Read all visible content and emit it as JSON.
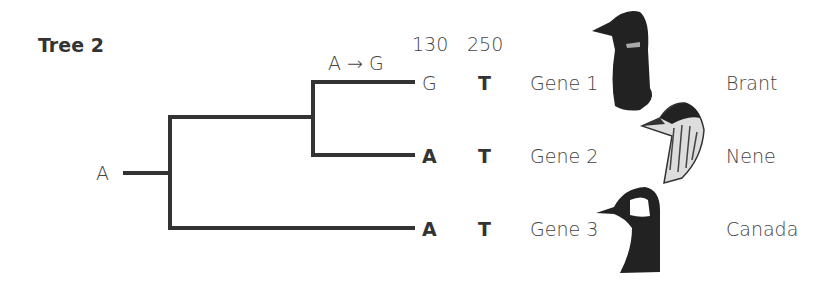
{
  "title": "Tree 2",
  "root_state": "A",
  "mutation_label": "A → G",
  "site_headers": [
    "130",
    "250"
  ],
  "tips": [
    {
      "site130": "G",
      "site130_bold": false,
      "site250": "T",
      "gene": "Gene 1",
      "species": "Brant"
    },
    {
      "site130": "A",
      "site130_bold": true,
      "site250": "T",
      "gene": "Gene 2",
      "species": "Nene"
    },
    {
      "site130": "A",
      "site130_bold": true,
      "site250": "T",
      "gene": "Gene 3",
      "species": "Canada"
    }
  ],
  "icons": [
    "brant-goose-head",
    "nene-goose-head",
    "canada-goose-head"
  ]
}
